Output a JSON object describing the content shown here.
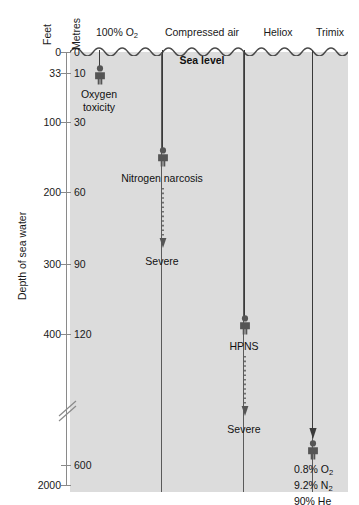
{
  "figure": {
    "axis_title": "Depth of sea water",
    "unit_feet": "Feet",
    "unit_metres": "Metres",
    "sea_level_label": "Sea level",
    "background_color": "#dcdcdc",
    "line_color": "#3a3a3a",
    "axis_color": "#8a8a8a"
  },
  "ticks": [
    {
      "feet": "0",
      "metres": "0"
    },
    {
      "feet": "33",
      "metres": "10"
    },
    {
      "feet": "100",
      "metres": "30"
    },
    {
      "feet": "200",
      "metres": "60"
    },
    {
      "feet": "300",
      "metres": "90"
    },
    {
      "feet": "400",
      "metres": "120"
    },
    {
      "feet": "",
      "metres": "600"
    },
    {
      "feet": "2000",
      "metres": ""
    }
  ],
  "columns": [
    {
      "id": "oxygen",
      "heading_text": "100% O",
      "heading_sub": "2"
    },
    {
      "id": "air",
      "heading_text": "Compressed air",
      "heading_sub": ""
    },
    {
      "id": "heliox",
      "heading_text": "Heliox",
      "heading_sub": ""
    },
    {
      "id": "trimix",
      "heading_text": "Trimix",
      "heading_sub": ""
    }
  ],
  "markers": [
    {
      "id": "oxygen-toxicity",
      "label_line1": "Oxygen",
      "label_line2": "toxicity"
    },
    {
      "id": "nitrogen-narcosis",
      "label_line1": "Nitrogen narcosis",
      "label_line2": ""
    },
    {
      "id": "hpns",
      "label_line1": "HPNS",
      "label_line2": ""
    }
  ],
  "severity": [
    {
      "id": "narcosis-severe",
      "label": "Severe"
    },
    {
      "id": "hpns-severe",
      "label": "Severe"
    }
  ],
  "trimix_mix": {
    "line1_value": "0.8% O",
    "line1_sub": "2",
    "line2_value": "9.2% N",
    "line2_sub": "2",
    "line3_value": "90% He",
    "line3_sub": ""
  }
}
